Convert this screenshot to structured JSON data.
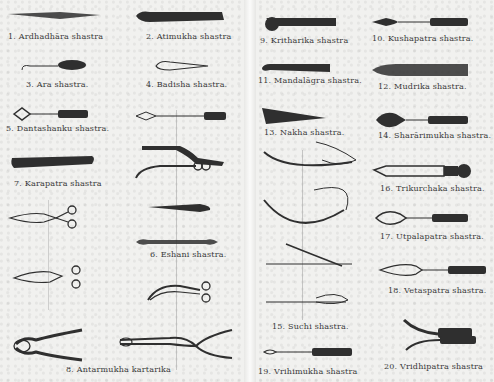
{
  "document": {
    "type": "illustrated plate of ancient surgical instruments",
    "left_page": {
      "labels": [
        {
          "id": 1,
          "text": "1. Ardhadhāra shastra"
        },
        {
          "id": 2,
          "text": "2. Atimukha shastra"
        },
        {
          "id": 3,
          "text": "3. Ara shastra."
        },
        {
          "id": 4,
          "text": "4. Badisha shastra."
        },
        {
          "id": 5,
          "text": "5. Dantashanku shastra."
        },
        {
          "id": 7,
          "text": "7. Karapatra shastra"
        },
        {
          "id": 6,
          "text": "6. Eshani shastra."
        },
        {
          "id": 8,
          "text": "8. Antarmukha kartarika"
        }
      ]
    },
    "right_page": {
      "labels": [
        {
          "id": 9,
          "text": "9. Kritharika shastra"
        },
        {
          "id": 10,
          "text": "10. Kushapatra shastra."
        },
        {
          "id": 11,
          "text": "11. Mandalāgra shastra."
        },
        {
          "id": 12,
          "text": "12. Mudrika shastra."
        },
        {
          "id": 13,
          "text": "13. Nakha shastra."
        },
        {
          "id": 14,
          "text": "14. Sharārimukha shastra."
        },
        {
          "id": 16,
          "text": "16. Trikurchaka shastra."
        },
        {
          "id": 17,
          "text": "17. Utpalapatra shastra."
        },
        {
          "id": 18,
          "text": "18. Vetaspatra shastra."
        },
        {
          "id": 15,
          "text": "15. Suchi shastra."
        },
        {
          "id": 19,
          "text": "19. Vrihimukha shastra"
        },
        {
          "id": 20,
          "text": "20. Vridhipatra shastra"
        }
      ]
    },
    "colors": {
      "paper": "#f1f1ef",
      "ink": "#2e2e2e",
      "label_ink": "#3a3a3a"
    }
  }
}
